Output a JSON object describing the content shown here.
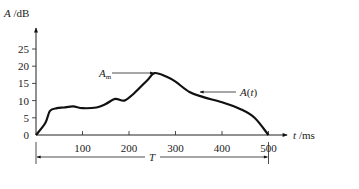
{
  "chart_data": {
    "type": "line",
    "title": "",
    "xlabel": "t /ms",
    "ylabel": "A /dB",
    "xlim": [
      0,
      500
    ],
    "ylim": [
      0,
      25
    ],
    "x_ticks": [
      100,
      200,
      300,
      400,
      500
    ],
    "y_ticks": [
      0,
      5,
      10,
      15,
      20,
      25
    ],
    "grid": false,
    "series": [
      {
        "name": "A(t)",
        "x": [
          0,
          20,
          30,
          45,
          60,
          80,
          100,
          130,
          150,
          170,
          190,
          210,
          240,
          255,
          280,
          300,
          330,
          360,
          400,
          440,
          470,
          500
        ],
        "values": [
          0,
          3.5,
          7,
          7.8,
          8,
          8.3,
          7.8,
          8,
          9,
          10.5,
          10,
          12,
          16,
          18,
          17,
          15.5,
          12.5,
          11,
          9.5,
          7.5,
          5,
          0
        ]
      }
    ],
    "annotations": [
      {
        "text": "A_m",
        "points_to": [
          255,
          18
        ],
        "desc": "peak amplitude"
      },
      {
        "text": "A(t)",
        "points_to": [
          340,
          12
        ],
        "desc": "curve label"
      },
      {
        "text": "T",
        "span": [
          0,
          500
        ],
        "desc": "duration"
      }
    ]
  },
  "labels": {
    "ylabel_italic": "A",
    "ylabel_unit": " /dB",
    "xlabel_italic": "t",
    "xlabel_unit": " /ms",
    "peak": "A",
    "peak_sub": "m",
    "curve": "A(t)",
    "duration": "T"
  }
}
